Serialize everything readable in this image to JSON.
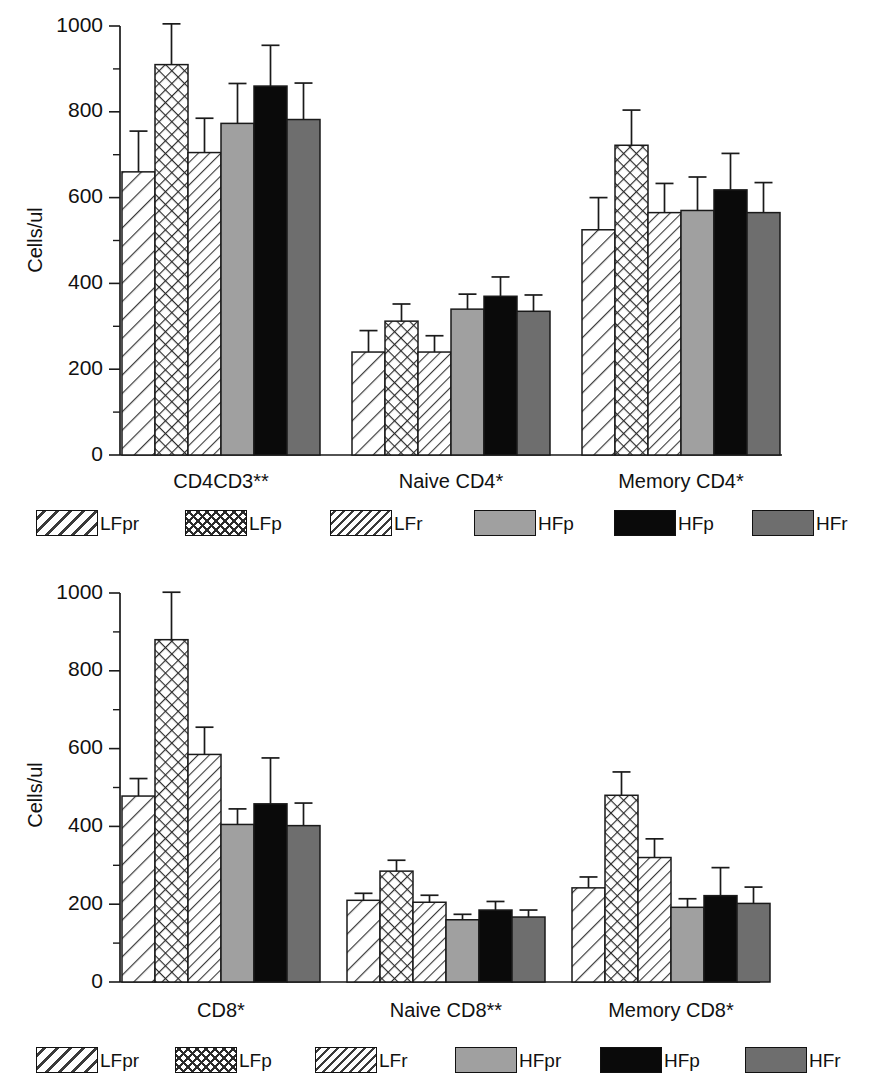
{
  "chart_data": [
    {
      "type": "bar",
      "id": "cd4-panel",
      "title": "",
      "xlabel": "",
      "ylabel": "Cells/ul",
      "ylim": [
        0,
        1000
      ],
      "yticks": [
        0,
        200,
        400,
        600,
        800,
        1000
      ],
      "ytick_labels": [
        "0",
        "200",
        "400",
        "600",
        "800",
        "1000"
      ],
      "yminor_ticks": [
        100,
        300,
        500,
        700,
        900
      ],
      "grid": false,
      "legend_position": "below",
      "categories": [
        "CD4CD3**",
        "Naive CD4*",
        "Memory CD4*"
      ],
      "series": [
        {
          "name": "LFpr",
          "pattern": "diagonal-wide",
          "color": "#ffffff",
          "values": [
            660,
            240,
            525
          ],
          "errors": [
            95,
            50,
            75
          ]
        },
        {
          "name": "LFp",
          "pattern": "cross-hatch",
          "color": "#ffffff",
          "values": [
            910,
            312,
            722
          ],
          "errors": [
            95,
            40,
            82
          ]
        },
        {
          "name": "LFr",
          "pattern": "diagonal-dense",
          "color": "#ffffff",
          "values": [
            705,
            240,
            565
          ],
          "errors": [
            80,
            38,
            68
          ]
        },
        {
          "name": "HFp",
          "pattern": "solid",
          "color": "#a0a0a0",
          "values": [
            773,
            340,
            570
          ],
          "errors": [
            93,
            35,
            78
          ]
        },
        {
          "name": "HFp",
          "pattern": "solid",
          "color": "#0a0a0a",
          "values": [
            860,
            370,
            618
          ],
          "errors": [
            95,
            45,
            85
          ]
        },
        {
          "name": "HFr",
          "pattern": "solid",
          "color": "#6e6e6e",
          "values": [
            782,
            335,
            565
          ],
          "errors": [
            85,
            38,
            70
          ]
        }
      ],
      "legend": [
        {
          "label": "LFpr",
          "pattern": "diagonal-wide",
          "color": "#ffffff"
        },
        {
          "label": "LFp",
          "pattern": "cross-hatch",
          "color": "#ffffff"
        },
        {
          "label": "LFr",
          "pattern": "diagonal-dense",
          "color": "#ffffff"
        },
        {
          "label": "HFp",
          "pattern": "solid",
          "color": "#a0a0a0"
        },
        {
          "label": "HFp",
          "pattern": "solid",
          "color": "#0a0a0a"
        },
        {
          "label": "HFr",
          "pattern": "solid",
          "color": "#6e6e6e"
        }
      ]
    },
    {
      "type": "bar",
      "id": "cd8-panel",
      "title": "",
      "xlabel": "",
      "ylabel": "Cells/ul",
      "ylim": [
        0,
        1000
      ],
      "yticks": [
        0,
        200,
        400,
        600,
        800,
        1000
      ],
      "ytick_labels": [
        "0",
        "200",
        "400",
        "600",
        "800",
        "1000"
      ],
      "yminor_ticks": [
        100,
        300,
        500,
        700,
        900
      ],
      "grid": false,
      "legend_position": "below",
      "categories": [
        "CD8*",
        "Naive CD8**",
        "Memory CD8*"
      ],
      "series": [
        {
          "name": "LFpr",
          "pattern": "diagonal-wide",
          "color": "#ffffff",
          "values": [
            478,
            210,
            242
          ],
          "errors": [
            45,
            18,
            28
          ]
        },
        {
          "name": "LFp",
          "pattern": "cross-hatch",
          "color": "#ffffff",
          "values": [
            880,
            285,
            480
          ],
          "errors": [
            122,
            28,
            60
          ]
        },
        {
          "name": "LFr",
          "pattern": "diagonal-dense",
          "color": "#ffffff",
          "values": [
            585,
            205,
            320
          ],
          "errors": [
            70,
            18,
            48
          ]
        },
        {
          "name": "HFpr",
          "pattern": "solid",
          "color": "#a0a0a0",
          "values": [
            405,
            160,
            192
          ],
          "errors": [
            40,
            14,
            22
          ]
        },
        {
          "name": "HFp",
          "pattern": "solid",
          "color": "#0a0a0a",
          "values": [
            458,
            185,
            222
          ],
          "errors": [
            118,
            22,
            72
          ]
        },
        {
          "name": "HFr",
          "pattern": "solid",
          "color": "#6e6e6e",
          "values": [
            402,
            167,
            202
          ],
          "errors": [
            58,
            18,
            42
          ]
        }
      ],
      "legend": [
        {
          "label": "LFpr",
          "pattern": "diagonal-wide",
          "color": "#ffffff"
        },
        {
          "label": "LFp",
          "pattern": "cross-hatch",
          "color": "#ffffff"
        },
        {
          "label": "LFr",
          "pattern": "diagonal-dense",
          "color": "#ffffff"
        },
        {
          "label": "HFpr",
          "pattern": "solid",
          "color": "#a0a0a0"
        },
        {
          "label": "HFp",
          "pattern": "solid",
          "color": "#0a0a0a"
        },
        {
          "label": "HFr",
          "pattern": "solid",
          "color": "#6e6e6e"
        }
      ]
    }
  ]
}
